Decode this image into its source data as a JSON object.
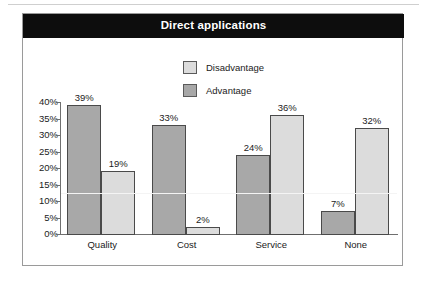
{
  "chart_data": {
    "type": "bar",
    "title": "Direct applications",
    "xlabel": "",
    "ylabel": "",
    "ylim": [
      0,
      40
    ],
    "ytick_labels": [
      "0%",
      "5%",
      "10%",
      "15%",
      "20%",
      "25%",
      "30%",
      "35%",
      "40%"
    ],
    "ytick_values": [
      0,
      5,
      10,
      15,
      20,
      25,
      30,
      35,
      40
    ],
    "grid": true,
    "gridlines_highlighted": [
      12.5
    ],
    "legend_position": "top-center",
    "categories": [
      "Quality",
      "Cost",
      "Service",
      "None"
    ],
    "series": [
      {
        "name": "Advantage",
        "color": "#a8a8a8",
        "values": [
          39,
          33,
          24,
          7
        ],
        "value_labels": [
          "39%",
          "33%",
          "24%",
          "7%"
        ]
      },
      {
        "name": "Disadvantage",
        "color": "#dcdcdc",
        "values": [
          19,
          2,
          36,
          32
        ],
        "value_labels": [
          "19%",
          "2%",
          "36%",
          "32%"
        ]
      }
    ],
    "bar_order_in_group": [
      "Advantage",
      "Disadvantage"
    ]
  },
  "legend": {
    "entries": [
      {
        "label": "Disadvantage",
        "color": "#dcdcdc"
      },
      {
        "label": "Advantage",
        "color": "#a8a8a8"
      }
    ]
  },
  "colors": {
    "title_bar_background": "#0d0d0d",
    "title_text": "#ffffff",
    "advantage": "#a8a8a8",
    "disadvantage": "#dcdcdc",
    "bar_outline": "#4a4a4a",
    "axis": "#6f6f6f",
    "frame": "#9a9a9a",
    "page_background": "#ffffff",
    "white_gridline": "#f4f4f4"
  }
}
